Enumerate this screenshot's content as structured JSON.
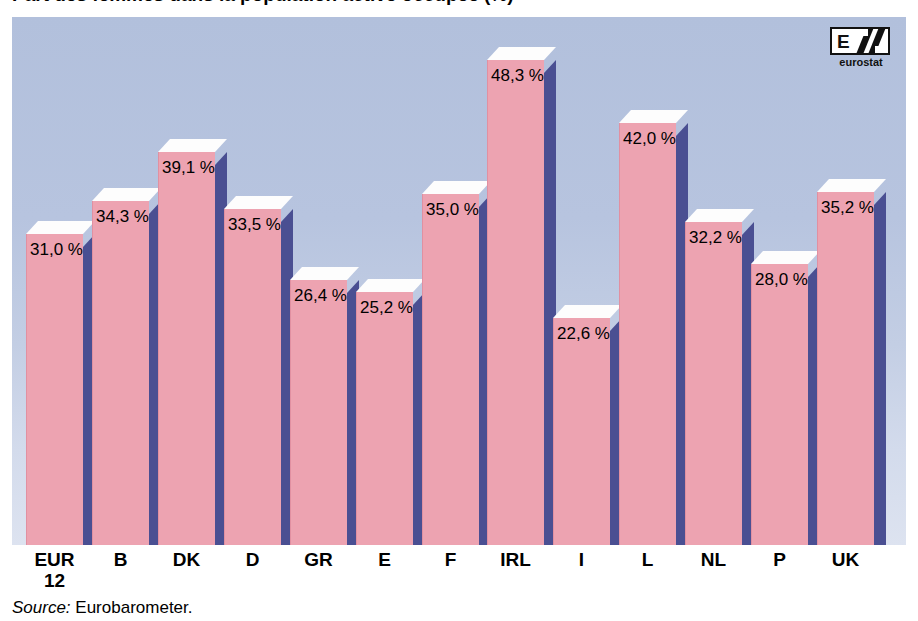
{
  "title": {
    "text_cropped": "Part des femmes dans la population active occupée (%)"
  },
  "logo": {
    "name": "eurostat-logo",
    "wordmark": "eurostat",
    "letter": "E"
  },
  "source": {
    "label": "Source:",
    "value": "Eurobarometer."
  },
  "colors": {
    "bar_front": "#eda3b1",
    "bar_side": "#4a4f92",
    "bar_top": "#fdfdfd",
    "panel_top": "#b2c0dc",
    "panel_bottom": "#dde3f0",
    "text": "#000000"
  },
  "chart_data": {
    "type": "bar",
    "title": "Part des femmes dans la population active occupée (%)",
    "xlabel": "",
    "ylabel": "",
    "ylim": [
      0,
      52
    ],
    "grid": false,
    "legend": null,
    "value_suffix": " %",
    "decimal_separator": ",",
    "categories": [
      "EUR\n12",
      "B",
      "DK",
      "D",
      "GR",
      "E",
      "F",
      "IRL",
      "I",
      "L",
      "NL",
      "P",
      "UK"
    ],
    "values": [
      31.0,
      34.3,
      39.1,
      33.5,
      26.4,
      25.2,
      35.0,
      48.3,
      22.6,
      42.0,
      32.2,
      28.0,
      35.2
    ],
    "value_labels": [
      "31,0 %",
      "34,3 %",
      "39,1 %",
      "33,5 %",
      "26,4 %",
      "25,2 %",
      "35,0 %",
      "48,3 %",
      "22,6 %",
      "42,0 %",
      "32,2 %",
      "28,0 %",
      "35,2 %"
    ],
    "annotations": [
      "Source: Eurobarometer."
    ]
  }
}
